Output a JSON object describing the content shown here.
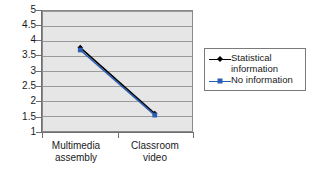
{
  "chart_data": {
    "type": "line",
    "title": "",
    "xlabel": "",
    "ylabel": "",
    "categories": [
      "Multimedia assembly",
      "Classroom video"
    ],
    "category_lines": [
      [
        "Multimedia",
        "assembly"
      ],
      [
        "Classroom",
        "video"
      ]
    ],
    "ylim": [
      1,
      5
    ],
    "yticks": [
      5,
      4.5,
      4,
      3.5,
      3,
      2.5,
      2,
      1.5,
      1
    ],
    "ytick_labels": [
      "5",
      "4.5",
      "4",
      "3.5",
      "3",
      "2.5",
      "2",
      "1.5",
      "1"
    ],
    "grid": true,
    "legend_position": "right",
    "series": [
      {
        "name": "Statistical information",
        "name_lines": [
          "Statistical",
          "information"
        ],
        "values": [
          3.78,
          1.58
        ],
        "color": "#000000",
        "marker": "diamond"
      },
      {
        "name": "No information",
        "name_lines": [
          "No information"
        ],
        "values": [
          3.7,
          1.53
        ],
        "color": "#2b5fb3",
        "marker": "square"
      }
    ]
  },
  "axes": {
    "y_tick_labels": [
      "5",
      "4.5",
      "4",
      "3.5",
      "3",
      "2.5",
      "2",
      "1.5",
      "1"
    ],
    "x_tick_labels": [
      {
        "line1": "Multimedia",
        "line2": "assembly"
      },
      {
        "line1": "Classroom",
        "line2": "video"
      }
    ]
  },
  "legend": {
    "entries": [
      {
        "label": "Statistical\ninformation",
        "color": "#000000"
      },
      {
        "label": "No information",
        "color": "#2b5fb3"
      }
    ]
  },
  "colors": {
    "plot_background": "#e6e6e6",
    "gridline": "#9a9a9a",
    "axis": "#6f6f6f",
    "series_1": "#000000",
    "series_2": "#2b5fb3",
    "page_background": "#ffffff"
  }
}
